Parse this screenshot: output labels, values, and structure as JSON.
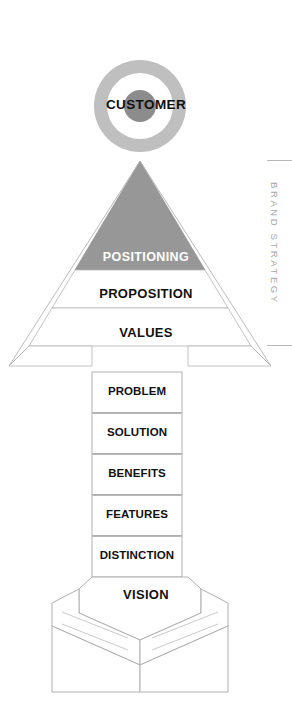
{
  "diagram": {
    "type": "pyramid-arrow",
    "side_label": "BRAND STRATEGY",
    "target": {
      "label": "CUSTOMER",
      "shape": "bullseye",
      "ring_color": "#bfbfbf",
      "gap_color": "#ffffff",
      "center_color": "#8c8c8c",
      "center_x": 140,
      "center_y": 106,
      "outer_radius": 46,
      "gap_radius": 33,
      "center_radius": 16
    },
    "arrowhead": {
      "fill": "#979797",
      "stroke": "#9a9a9a",
      "apex_x": 140,
      "apex_y": 161
    },
    "tiers": [
      {
        "label": "POSITIONING",
        "fill": "#979797",
        "text_color": "#ffffff",
        "band_top": 244,
        "band_bottom": 270
      },
      {
        "label": "PROPOSITION",
        "fill": "#ffffff",
        "text_color": "#111111",
        "band_top": 270,
        "band_bottom": 308
      },
      {
        "label": "VALUES",
        "fill": "#ffffff",
        "text_color": "#111111",
        "band_top": 308,
        "band_bottom": 346
      }
    ],
    "stages": [
      {
        "label": "PROBLEM",
        "top": 372,
        "height": 41
      },
      {
        "label": "SOLUTION",
        "top": 413,
        "height": 41
      },
      {
        "label": "BENEFITS",
        "top": 454,
        "height": 41
      },
      {
        "label": "FEATURES",
        "top": 495,
        "height": 41
      },
      {
        "label": "DISTINCTION",
        "top": 536,
        "height": 41
      }
    ],
    "base": {
      "label": "VISION",
      "shape": "chevron-tail-fins",
      "fill": "#ffffff",
      "stroke": "#b0b0b0"
    },
    "colors": {
      "accent_gray": "#979797",
      "light_gray": "#bfbfbf",
      "dark_gray": "#8c8c8c",
      "outline": "#b0b0b0",
      "label_gray": "#a8a8a8",
      "text": "#111111",
      "background": "#ffffff"
    }
  }
}
